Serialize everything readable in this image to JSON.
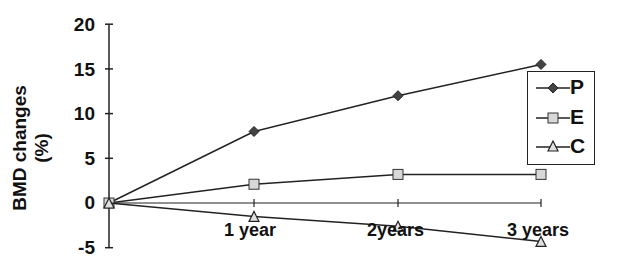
{
  "chart_data": {
    "type": "line",
    "title": "",
    "xlabel": "",
    "ylabel": "BMD changes (%)",
    "categories": [
      "0",
      "1 year",
      "2years",
      "3 years"
    ],
    "x_tick_labels": [
      "1 year",
      "2years",
      "3 years"
    ],
    "y_ticks": [
      -5,
      0,
      5,
      10,
      15,
      20
    ],
    "ylim": [
      -5,
      20
    ],
    "grid": false,
    "legend_position": "right",
    "series": [
      {
        "name": "P",
        "marker": "diamond",
        "values": [
          0,
          8.0,
          12.0,
          15.5
        ]
      },
      {
        "name": "E",
        "marker": "square",
        "values": [
          0,
          2.1,
          3.2,
          3.2
        ]
      },
      {
        "name": "C",
        "marker": "triangle",
        "values": [
          0,
          -1.5,
          -2.6,
          -4.3
        ]
      }
    ]
  },
  "colors": {
    "line": "#222222",
    "P_marker": "#444444",
    "E_marker": "#d8d8d8",
    "C_marker": "#e0e0e0"
  }
}
